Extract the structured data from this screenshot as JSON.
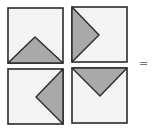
{
  "colors": {
    "square_fill": "#f4f4f4",
    "triangle_fill": "#a9a9a9",
    "stroke": "#2b2b2b",
    "equals_color": "#777777"
  },
  "tiles": [
    {
      "id": "top-left",
      "x": 8,
      "y": 8,
      "size": 55,
      "triangle": "bottom-edge",
      "points": "8,63 63,63 35,37"
    },
    {
      "id": "top-right",
      "x": 72,
      "y": 7,
      "size": 55,
      "triangle": "left-edge",
      "points": "72,7 72,62 99,35"
    },
    {
      "id": "bottom-left",
      "x": 8,
      "y": 69,
      "size": 55,
      "triangle": "right-edge",
      "points": "63,69 63,124 36,97"
    },
    {
      "id": "bottom-right",
      "x": 72,
      "y": 68,
      "size": 55,
      "triangle": "top-edge",
      "points": "72,68 127,68 100,96"
    }
  ],
  "equals_sign": "="
}
